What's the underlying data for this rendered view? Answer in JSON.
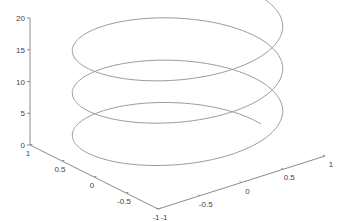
{
  "chart_data": {
    "type": "line3d",
    "title": "",
    "xlabel": "",
    "ylabel": "",
    "zlabel": "",
    "series": [
      {
        "name": "helix",
        "parametric": "x = cos(t), y = sin(t), z = t / (2*pi) * 6.67",
        "t_range": [
          0,
          18.85
        ],
        "turns": 3,
        "radius": 1,
        "z_range": [
          0,
          20
        ]
      }
    ],
    "xlim": [
      -1,
      1
    ],
    "ylim": [
      -1,
      1
    ],
    "zlim": [
      0,
      20
    ],
    "x_ticks": [
      "-1",
      "-0.5",
      "0",
      "0.5",
      "1"
    ],
    "y_ticks": [
      "1",
      "0.5",
      "0",
      "-0.5",
      "-1"
    ],
    "z_ticks": [
      "0",
      "5",
      "10",
      "15",
      "20"
    ],
    "grid": false,
    "legend": null,
    "colors": {
      "curve": "#9a9a9a",
      "axis": "#8c8c8c",
      "text": "#444444"
    }
  },
  "projection": {
    "origin": [
      158,
      209
    ],
    "x_unit": [
      83.5,
      -26.5
    ],
    "y_unit": [
      -64,
      -32
    ],
    "z_unit": [
      0,
      -6.35
    ]
  }
}
